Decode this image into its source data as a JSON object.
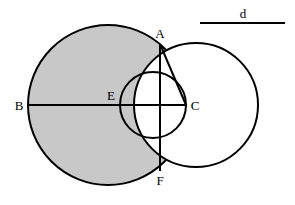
{
  "figure": {
    "kind": "geometry-diagram",
    "background_color": "#ffffff",
    "stroke_color": "#000000",
    "shaded_fill_color": "#c8c8c8",
    "unshaded_fill_color": "#ffffff",
    "stroke_width": 2,
    "chord_stroke_width": 2
  },
  "circles": [
    {
      "id": "large-left-circle",
      "name": "large shaded circle",
      "cx": 108,
      "cy": 105,
      "r": 80,
      "filled": true,
      "fill": "#c8c8c8"
    },
    {
      "id": "middle-circle",
      "name": "middle circle through A E C F",
      "cx": 153,
      "cy": 105,
      "r": 33,
      "filled": false,
      "fill": "none"
    },
    {
      "id": "right-circle",
      "name": "right unshaded circle",
      "cx": 196,
      "cy": 105,
      "r": 62,
      "filled": false,
      "fill": "#ffffff"
    }
  ],
  "points": [
    {
      "id": "A",
      "label": "A",
      "x": 160,
      "y": 44,
      "label_x": 160,
      "label_y": 38,
      "description": "upper intersection of large and right circles"
    },
    {
      "id": "B",
      "label": "B",
      "x": 28,
      "y": 105,
      "label_x": 19,
      "label_y": 110,
      "description": "left end of horizontal diameter"
    },
    {
      "id": "C",
      "label": "C",
      "x": 186,
      "y": 105,
      "label_x": 195,
      "label_y": 110,
      "description": "right end of horizontal chord"
    },
    {
      "id": "E",
      "label": "E",
      "x": 120,
      "y": 105,
      "label_x": 111,
      "label_y": 100,
      "description": "left point of middle circle on the diameter"
    },
    {
      "id": "F",
      "label": "F",
      "x": 160,
      "y": 171,
      "label_x": 160,
      "label_y": 185,
      "description": "lower intersection of large and right circles"
    }
  ],
  "segments": [
    {
      "id": "segment-BC",
      "name": "horizontal diameter B to C",
      "x1": 28,
      "y1": 105,
      "x2": 186,
      "y2": 105
    },
    {
      "id": "segment-AF",
      "name": "vertical chord A to F",
      "x1": 160,
      "y1": 44,
      "x2": 160,
      "y2": 171
    },
    {
      "id": "segment-AC",
      "name": "diagonal chord A to C",
      "x1": 160,
      "y1": 44,
      "x2": 186,
      "y2": 105
    }
  ],
  "scale_bar": {
    "id": "scale-bar-d",
    "label": "d",
    "label_x": 243,
    "label_y": 18,
    "x1": 200,
    "y1": 23,
    "x2": 285,
    "y2": 23,
    "stroke_width": 2
  },
  "shaded_regions": [
    {
      "id": "shaded-region-main",
      "name": "large circle minus the lens right of the middle circle arc",
      "description": "The large left circle is filled gray; the portion of the right circle overlapping it between A and F stays white, and the middle circle's right arc bounds the gray near C."
    }
  ]
}
